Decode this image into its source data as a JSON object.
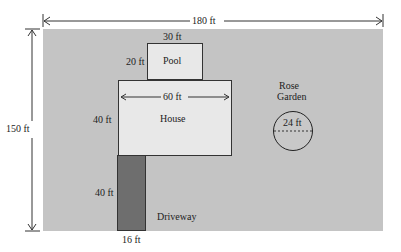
{
  "diagram": {
    "type": "property site plan",
    "lot": {
      "width_label": "180 ft",
      "height_label": "150 ft",
      "color": "#c4c4c4"
    },
    "pool": {
      "label": "Pool",
      "width_label": "30 ft",
      "height_label": "20 ft",
      "color": "#e8e8e8"
    },
    "house": {
      "label": "House",
      "width_label": "60 ft",
      "height_label": "40 ft",
      "color": "#e8e8e8"
    },
    "driveway": {
      "label": "Driveway",
      "height_label": "40 ft",
      "width_label": "16 ft",
      "color": "#6e6e6e"
    },
    "rose_garden": {
      "label_line1": "Rose",
      "label_line2": "Garden",
      "diameter_label": "24 ft"
    }
  }
}
